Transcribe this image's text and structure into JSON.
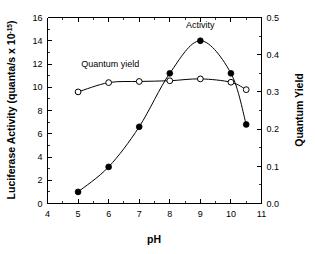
{
  "chart_data": {
    "type": "line",
    "title": "",
    "xlabel": "pH",
    "ylabel": "Luciferase Activity (quanta/s x 10",
    "ylabel_exponent": "-15",
    "ylabel_close": ")",
    "y2label": "Quantum Yield",
    "xlim": [
      4,
      11
    ],
    "ylim": [
      0,
      16
    ],
    "y2lim": [
      0.0,
      0.5
    ],
    "xticks": [
      "4",
      "5",
      "6",
      "7",
      "8",
      "9",
      "10",
      "11"
    ],
    "xtick_values": [
      4,
      5,
      6,
      7,
      8,
      9,
      10,
      11
    ],
    "yticks": [
      "0",
      "2",
      "4",
      "6",
      "8",
      "10",
      "12",
      "14",
      "16"
    ],
    "ytick_values": [
      0,
      2,
      4,
      6,
      8,
      10,
      12,
      14,
      16
    ],
    "y2ticks": [
      "0.0",
      "0.1",
      "0.2",
      "0.3",
      "0.4",
      "0.5"
    ],
    "y2tick_values": [
      0.0,
      0.1,
      0.2,
      0.3,
      0.4,
      0.5
    ],
    "grid": false,
    "legend_position": "inline-annotations",
    "series": [
      {
        "name": "Activity",
        "axis": "left",
        "marker": "filled-circle",
        "x": [
          5.0,
          6.0,
          7.0,
          8.0,
          9.0,
          10.0,
          10.5
        ],
        "values": [
          1.0,
          3.15,
          6.6,
          11.2,
          14.0,
          11.2,
          6.8
        ]
      },
      {
        "name": "Quantum yield",
        "axis": "right",
        "marker": "open-circle",
        "x": [
          5.0,
          6.0,
          7.0,
          8.0,
          9.0,
          10.0,
          10.5
        ],
        "values": [
          0.3,
          0.325,
          0.328,
          0.33,
          0.335,
          0.326,
          0.306
        ]
      }
    ],
    "annotations": [
      {
        "text": "Activity",
        "x": 9.0,
        "y": 15.1
      },
      {
        "text": "Quantum yield",
        "x": 6.05,
        "y": 11.7
      }
    ]
  },
  "colors": {
    "axis": "#000000",
    "curve": "#000000",
    "marker_fill": "#000000",
    "marker_open": "#ffffff",
    "background": "#ffffff"
  }
}
